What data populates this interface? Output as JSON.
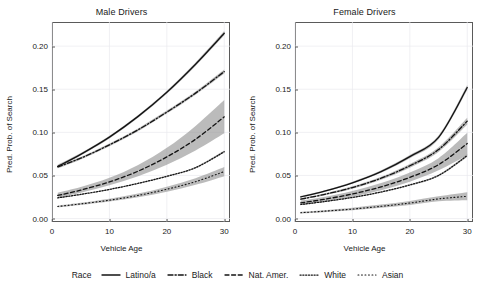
{
  "chart_data": {
    "type": "line",
    "title": "",
    "xlabel": "Vehicle Age",
    "ylabel": "Pred. Prob. of Search",
    "xlim": [
      0,
      31
    ],
    "ylim": [
      -0.004,
      0.228
    ],
    "xticks": [
      "0",
      "10",
      "20",
      "30"
    ],
    "xtick_values": [
      0,
      10,
      20,
      30
    ],
    "yticks": [
      "0.00",
      "0.05",
      "0.10",
      "0.15",
      "0.20"
    ],
    "ytick_values": [
      0.0,
      0.05,
      0.1,
      0.15,
      0.2
    ],
    "grid": true,
    "legend_position": "bottom",
    "legend_title": "Race",
    "x": [
      1,
      5,
      10,
      15,
      20,
      25,
      30
    ],
    "panels": [
      {
        "label": "Male Drivers",
        "series": [
          {
            "name": "Latino/a",
            "linestyle": "solid",
            "values": [
              0.0605,
              0.0745,
              0.0945,
              0.1185,
              0.1465,
              0.179,
              0.215
            ],
            "ribbon_low": [
              0.0585,
              0.073,
              0.093,
              0.1168,
              0.1447,
              0.177,
              0.2125
            ],
            "ribbon_high": [
              0.0625,
              0.076,
              0.096,
              0.1202,
              0.1483,
              0.181,
              0.2175
            ]
          },
          {
            "name": "Black",
            "linestyle": "dashdot",
            "values": [
              0.06,
              0.07,
              0.0855,
              0.103,
              0.1235,
              0.1455,
              0.1705
            ],
            "ribbon_low": [
              0.0583,
              0.0686,
              0.084,
              0.1014,
              0.1218,
              0.1437,
              0.1682
            ],
            "ribbon_high": [
              0.0617,
              0.0714,
              0.087,
              0.1046,
              0.1252,
              0.1473,
              0.1728
            ]
          },
          {
            "name": "Nat. Amer.",
            "linestyle": "dashed",
            "values": [
              0.0268,
              0.033,
              0.0425,
              0.055,
              0.0715,
              0.092,
              0.118
            ],
            "ribbon_low": [
              0.0238,
              0.0298,
              0.0385,
              0.0492,
              0.0625,
              0.079,
              0.099
            ],
            "ribbon_high": [
              0.03,
              0.0365,
              0.0472,
              0.062,
              0.082,
              0.1075,
              0.1375
            ]
          },
          {
            "name": "White",
            "linestyle": "dotted",
            "values": [
              0.024,
              0.028,
              0.0338,
              0.0408,
              0.049,
              0.059,
              0.0775
            ],
            "ribbon_low": [
              0.0233,
              0.0273,
              0.033,
              0.04,
              0.0482,
              0.0581,
              0.0762
            ],
            "ribbon_high": [
              0.0247,
              0.0287,
              0.0346,
              0.0416,
              0.0498,
              0.0599,
              0.0788
            ]
          },
          {
            "name": "Asian",
            "linestyle": "fine-dotted",
            "values": [
              0.014,
              0.017,
              0.0213,
              0.0268,
              0.034,
              0.0428,
              0.0545
            ],
            "ribbon_low": [
              0.013,
              0.0158,
              0.0198,
              0.0248,
              0.0312,
              0.0392,
              0.0492
            ],
            "ribbon_high": [
              0.015,
              0.0183,
              0.023,
              0.029,
              0.037,
              0.0468,
              0.0598
            ]
          }
        ]
      },
      {
        "label": "Female Drivers",
        "series": [
          {
            "name": "Latino/a",
            "linestyle": "solid",
            "values": [
              0.0252,
              0.0315,
              0.0415,
              0.0545,
              0.0718,
              0.0942,
              0.152
            ],
            "ribbon_low": [
              0.0242,
              0.0305,
              0.0403,
              0.053,
              0.07,
              0.092,
              0.149
            ],
            "ribbon_high": [
              0.0262,
              0.0325,
              0.0427,
              0.056,
              0.0736,
              0.0964,
              0.155
            ]
          },
          {
            "name": "Black",
            "linestyle": "dashdot",
            "values": [
              0.0225,
              0.0278,
              0.036,
              0.0468,
              0.0612,
              0.08,
              0.113
            ],
            "ribbon_low": [
              0.0215,
              0.0266,
              0.0345,
              0.045,
              0.059,
              0.0772,
              0.109
            ],
            "ribbon_high": [
              0.0235,
              0.029,
              0.0375,
              0.0486,
              0.0634,
              0.0828,
              0.117
            ]
          },
          {
            "name": "Nat. Amer.",
            "linestyle": "dashed",
            "values": [
              0.0182,
              0.0222,
              0.0285,
              0.0368,
              0.0478,
              0.0625,
              0.087
            ],
            "ribbon_low": [
              0.0158,
              0.0196,
              0.0253,
              0.0328,
              0.0428,
              0.056,
              0.0735
            ],
            "ribbon_high": [
              0.0208,
              0.025,
              0.032,
              0.0412,
              0.0535,
              0.07,
              0.0995
            ]
          },
          {
            "name": "White",
            "linestyle": "dotted",
            "values": [
              0.0163,
              0.0196,
              0.0245,
              0.0308,
              0.039,
              0.05,
              0.073
            ],
            "ribbon_low": [
              0.0157,
              0.019,
              0.0238,
              0.03,
              0.0381,
              0.0489,
              0.0714
            ],
            "ribbon_high": [
              0.0169,
              0.0202,
              0.0252,
              0.0316,
              0.0399,
              0.0511,
              0.0746
            ]
          },
          {
            "name": "Asian",
            "linestyle": "fine-dotted",
            "values": [
              0.0068,
              0.0085,
              0.011,
              0.0142,
              0.018,
              0.0228,
              0.0258
            ],
            "ribbon_low": [
              0.0058,
              0.0073,
              0.0096,
              0.0124,
              0.0158,
              0.02,
              0.0212
            ],
            "ribbon_high": [
              0.0078,
              0.0097,
              0.0126,
              0.0162,
              0.0204,
              0.0258,
              0.0305
            ]
          }
        ]
      }
    ]
  },
  "legend": {
    "title": "Race",
    "items": [
      {
        "label": "Latino/a",
        "style": "solid"
      },
      {
        "label": "Black",
        "style": "dashdot"
      },
      {
        "label": "Nat. Amer.",
        "style": "dashed"
      },
      {
        "label": "White",
        "style": "dotted"
      },
      {
        "label": "Asian",
        "style": "fine-dotted"
      }
    ]
  },
  "colors": {
    "line": "#131313",
    "ribbon": "#8d8d8d",
    "grid": "#e9e9ee",
    "axis": "#5a5a5a",
    "background": "#ffffff"
  }
}
